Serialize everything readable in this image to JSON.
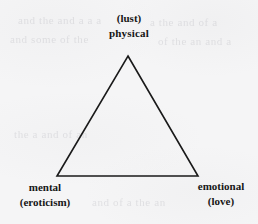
{
  "figure": {
    "type": "triangle-diagram",
    "background_color": "#f5f5f6",
    "stroke_color": "#1a1a1a",
    "text_color": "#161616"
  },
  "diagram": {
    "shape": "triangle",
    "vertices": [
      {
        "id": "top",
        "x": 128,
        "y": 56,
        "primary": "physical",
        "secondary": "(lust)"
      },
      {
        "id": "bottom-left",
        "x": 57,
        "y": 176,
        "primary": "mental",
        "secondary": "(eroticism)"
      },
      {
        "id": "bottom-right",
        "x": 198,
        "y": 176,
        "primary": "emotional",
        "secondary": "(love)"
      }
    ],
    "points_path": "128,56 198,176 57,176"
  },
  "labels": {
    "top": {
      "line1": "(lust)",
      "line2": "physical"
    },
    "bottom_left": {
      "line1": "mental",
      "line2": "(eroticism)"
    },
    "bottom_right": {
      "line1": "emotional",
      "line2": "(love)"
    }
  },
  "ghost_text": {
    "l1": "and the and a a a",
    "l2": "and some of the",
    "l3": "a the and of a",
    "l4": "of the an and a",
    "l5": "the a and of an",
    "l6": "and of a the an"
  }
}
